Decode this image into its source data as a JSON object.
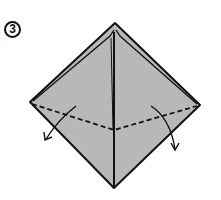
{
  "diagram": {
    "step_number": "3",
    "paper_color": "#b8b8b8",
    "line_color": "#111111",
    "shape": "square-base (kite) with valley fold lines",
    "fold_line": "dashed valley fold across left and right flaps meeting at center",
    "arrows": [
      "left-flap-fold-down-arrow",
      "right-flap-fold-down-arrow"
    ]
  }
}
